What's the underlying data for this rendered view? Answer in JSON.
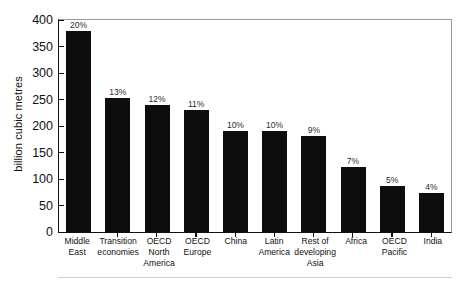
{
  "chart_data": {
    "type": "bar",
    "title": "",
    "xlabel": "",
    "ylabel": "billion cubic metres",
    "ylim": [
      0,
      400
    ],
    "yticks": [
      0,
      50,
      100,
      150,
      200,
      250,
      300,
      350,
      400
    ],
    "grid": false,
    "legend": "none",
    "categories": [
      "Middle East",
      "Transition economies",
      "OECD North America",
      "OECD Europe",
      "China",
      "Latin America",
      "Rest of developing Asia",
      "Africa",
      "OECD Pacific",
      "India"
    ],
    "category_lines": [
      [
        "Middle",
        "East"
      ],
      [
        "Transition",
        "economies"
      ],
      [
        "OECD",
        "North",
        "America"
      ],
      [
        "OECD",
        "Europe"
      ],
      [
        "China"
      ],
      [
        "Latin",
        "America"
      ],
      [
        "Rest of",
        "developing",
        "Asia"
      ],
      [
        "Africa"
      ],
      [
        "OECD",
        "Pacific"
      ],
      [
        "India"
      ]
    ],
    "values": [
      380,
      252,
      240,
      230,
      190,
      190,
      181,
      122,
      86,
      73
    ],
    "data_labels": [
      "20%",
      "13%",
      "12%",
      "11%",
      "10%",
      "10%",
      "9%",
      "7%",
      "5%",
      "4%"
    ],
    "bar_color": "#0d0d0d"
  }
}
